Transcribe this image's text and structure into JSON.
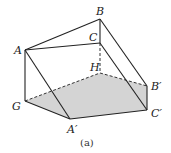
{
  "figure": {
    "caption": "(a)",
    "shade_color": "#d4d4d4",
    "line_color": "#222222",
    "vertices": {
      "A": {
        "label": "A",
        "x": 25,
        "y": 50
      },
      "B": {
        "label": "B",
        "x": 100,
        "y": 19
      },
      "C": {
        "label": "C",
        "x": 100,
        "y": 43
      },
      "H": {
        "label": "H",
        "x": 100,
        "y": 73
      },
      "G": {
        "label": "G",
        "x": 25,
        "y": 101
      },
      "A_prime": {
        "label": "A′",
        "x": 70,
        "y": 119
      },
      "B_prime": {
        "label": "B′",
        "x": 147,
        "y": 86
      },
      "C_prime": {
        "label": "C′",
        "x": 147,
        "y": 110
      }
    },
    "shaded_face": [
      "G",
      "H",
      "B′",
      "C′",
      "A′"
    ]
  }
}
